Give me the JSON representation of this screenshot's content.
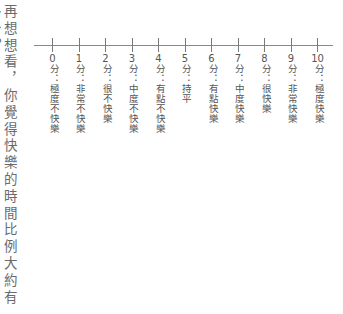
{
  "question": "再想想看，你覺得快樂的時間比例大約有多少？",
  "scale": {
    "line_color": "#8a8a8a",
    "text_color": "#555555",
    "points": [
      {
        "value": "0",
        "unit": "分",
        "sep": "：",
        "desc": "極度不快樂"
      },
      {
        "value": "1",
        "unit": "分",
        "sep": "：",
        "desc": "非常不快樂"
      },
      {
        "value": "2",
        "unit": "分",
        "sep": "：",
        "desc": "很不快樂"
      },
      {
        "value": "3",
        "unit": "分",
        "sep": "：",
        "desc": "中度不快樂"
      },
      {
        "value": "4",
        "unit": "分",
        "sep": "：",
        "desc": "有點不快樂"
      },
      {
        "value": "5",
        "unit": "分",
        "sep": "：",
        "desc": "持平"
      },
      {
        "value": "6",
        "unit": "分",
        "sep": "：",
        "desc": "有點快樂"
      },
      {
        "value": "7",
        "unit": "分",
        "sep": "：",
        "desc": "中度快樂"
      },
      {
        "value": "8",
        "unit": "分",
        "sep": "：",
        "desc": "很快樂"
      },
      {
        "value": "9",
        "unit": "分",
        "sep": "：",
        "desc": "非常快樂"
      },
      {
        "value": "10",
        "unit": "分",
        "sep": "：",
        "desc": "極度快樂"
      }
    ]
  }
}
